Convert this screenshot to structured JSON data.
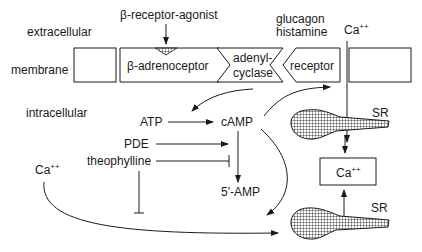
{
  "diagram": {
    "region_labels": {
      "extracellular": "extracellular",
      "membrane": "membrane",
      "intracellular": "intracellular"
    },
    "ligands": {
      "beta_agonist": "β-receptor-agonist",
      "glucagon": "glucagon",
      "histamine": "histamine",
      "ca_extracellular": "Ca",
      "ca_extracellular_sup": "++"
    },
    "membrane_elements": {
      "beta_adrenoceptor": "β-adrenoceptor",
      "adenyl_line1": "adenyl-",
      "adenyl_line2": "cyclase",
      "receptor": "receptor"
    },
    "intracellular": {
      "atp": "ATP",
      "camp": "cAMP",
      "pde": "PDE",
      "theophylline": "theophylline",
      "five_amp": "5'-AMP",
      "ca_left": "Ca",
      "ca_left_sup": "++",
      "ca_box": "Ca",
      "ca_box_sup": "++",
      "sr_top": "SR",
      "sr_bottom": "SR"
    },
    "colors": {
      "ink": "#1a1a1a",
      "background": "#ffffff"
    }
  }
}
